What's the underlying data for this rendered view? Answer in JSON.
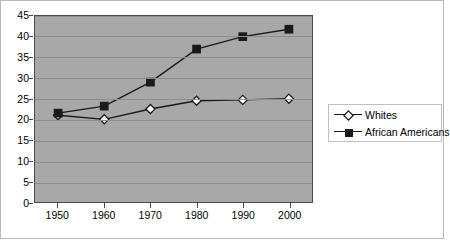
{
  "chart_data": {
    "type": "line",
    "title": "",
    "subtitle": "",
    "xlabel": "",
    "ylabel": "",
    "categories": [
      "1950",
      "1960",
      "1970",
      "1980",
      "1990",
      "2000"
    ],
    "x": [
      1950,
      1960,
      1970,
      1980,
      1990,
      2000
    ],
    "series": [
      {
        "name": "Whites",
        "marker": "open-diamond",
        "color": "#1a1a1a",
        "values": [
          21,
          20,
          22.5,
          24.5,
          24.7,
          25
        ]
      },
      {
        "name": "African Americans",
        "marker": "filled-square",
        "color": "#1a1a1a",
        "values": [
          21.5,
          23.2,
          29,
          37,
          40,
          41.8
        ]
      }
    ],
    "ylim": [
      0,
      45
    ],
    "yticks": [
      0,
      5,
      10,
      15,
      20,
      25,
      30,
      35,
      40,
      45
    ],
    "ytick_labels": [
      "0",
      "5",
      "10",
      "15",
      "20",
      "25",
      "30",
      "35",
      "40",
      "45"
    ],
    "grid": "horizontal",
    "legend_position": "right",
    "plot_background": "#a8a8a8",
    "page_background": "#ffffff",
    "gridline_color": "#8e8e8e",
    "axis_color": "#4a4a4a"
  },
  "legend": {
    "entries": [
      {
        "label": "Whites"
      },
      {
        "label": "African Americans"
      }
    ]
  }
}
